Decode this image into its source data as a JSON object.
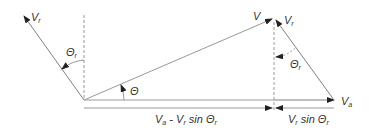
{
  "diagram": {
    "labels": {
      "vr_left": {
        "main": "V",
        "sub": "r"
      },
      "theta_r_left": {
        "main": "Θ",
        "sub": "r"
      },
      "theta": "Θ",
      "v": "V",
      "vr_right": {
        "main": "V",
        "sub": "r"
      },
      "theta_r_right": {
        "main": "Θ",
        "sub": "r"
      },
      "va": {
        "main": "V",
        "sub": "a"
      },
      "bottom_left": {
        "p1": "V",
        "s1": "a",
        "p2": " - V",
        "s2": "r",
        "p3": " sin Θ",
        "s3": "r"
      },
      "bottom_right": {
        "p1": "V",
        "s1": "r",
        "p2": " sin Θ",
        "s2": "r"
      }
    },
    "colors": {
      "line": "#808080",
      "arrow": "#222222",
      "text": "#333333"
    }
  }
}
